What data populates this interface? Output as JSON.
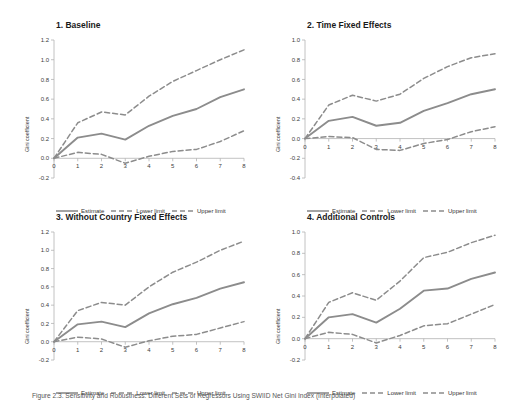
{
  "figure": {
    "caption": "Figure 2.3.  Sensitivity and Robustness: Different Sets of Regressors Using SWIID Net Gini Index (Interpolated)"
  },
  "legend": {
    "items": [
      {
        "label": "Estimate",
        "style": "solid",
        "color": "#8c8c8c"
      },
      {
        "label": "Lower limit",
        "style": "dashed",
        "color": "#8c8c8c"
      },
      {
        "label": "Upper limit",
        "style": "dashed",
        "color": "#8c8c8c"
      }
    ]
  },
  "chart_data": [
    {
      "type": "line",
      "title": "1. Baseline",
      "xlabel": "",
      "ylabel": "Gini coefficient",
      "x": [
        0,
        1,
        2,
        3,
        4,
        5,
        6,
        7,
        8
      ],
      "xticks": [
        "0",
        "1",
        "2",
        "3",
        "4",
        "5",
        "6",
        "7",
        "8"
      ],
      "yticks": [
        "-0.2",
        "0.0",
        "0.2",
        "0.4",
        "0.6",
        "0.8",
        "1.0",
        "1.2"
      ],
      "ylim": [
        -0.2,
        1.2
      ],
      "xlim": [
        0,
        8
      ],
      "grid": false,
      "series": [
        {
          "name": "Estimate",
          "style": "solid",
          "values": [
            0.0,
            0.21,
            0.25,
            0.19,
            0.33,
            0.43,
            0.5,
            0.62,
            0.7
          ]
        },
        {
          "name": "Lower limit",
          "style": "dashed",
          "values": [
            0.0,
            0.06,
            0.04,
            -0.05,
            0.02,
            0.07,
            0.09,
            0.17,
            0.28
          ]
        },
        {
          "name": "Upper limit",
          "style": "dashed",
          "values": [
            0.0,
            0.36,
            0.47,
            0.44,
            0.63,
            0.78,
            0.89,
            1.0,
            1.1
          ]
        }
      ]
    },
    {
      "type": "line",
      "title": "2. Time Fixed Effects",
      "xlabel": "",
      "ylabel": "Gini coefficient",
      "x": [
        0,
        1,
        2,
        3,
        4,
        5,
        6,
        7,
        8
      ],
      "xticks": [
        "0",
        "1",
        "2",
        "3",
        "4",
        "5",
        "6",
        "7",
        "8"
      ],
      "yticks": [
        "-0.4",
        "-0.2",
        "0.0",
        "0.2",
        "0.4",
        "0.6",
        "0.8",
        "1.0"
      ],
      "ylim": [
        -0.4,
        1.0
      ],
      "xlim": [
        0,
        8
      ],
      "grid": false,
      "series": [
        {
          "name": "Estimate",
          "style": "solid",
          "values": [
            0.0,
            0.18,
            0.22,
            0.13,
            0.16,
            0.28,
            0.36,
            0.45,
            0.5
          ]
        },
        {
          "name": "Lower limit",
          "style": "dashed",
          "values": [
            0.0,
            0.02,
            0.01,
            -0.11,
            -0.12,
            -0.05,
            -0.01,
            0.07,
            0.12
          ]
        },
        {
          "name": "Upper limit",
          "style": "dashed",
          "values": [
            0.0,
            0.34,
            0.44,
            0.38,
            0.45,
            0.61,
            0.73,
            0.82,
            0.86
          ]
        }
      ]
    },
    {
      "type": "line",
      "title": "3. Without Country Fixed Effects",
      "xlabel": "",
      "ylabel": "Gini coefficient",
      "x": [
        0,
        1,
        2,
        3,
        4,
        5,
        6,
        7,
        8
      ],
      "xticks": [
        "0",
        "1",
        "2",
        "3",
        "4",
        "5",
        "6",
        "7",
        "8"
      ],
      "yticks": [
        "-0.2",
        "0.0",
        "0.2",
        "0.4",
        "0.6",
        "0.8",
        "1.0",
        "1.2"
      ],
      "ylim": [
        -0.2,
        1.2
      ],
      "xlim": [
        0,
        8
      ],
      "grid": false,
      "series": [
        {
          "name": "Estimate",
          "style": "solid",
          "values": [
            0.0,
            0.19,
            0.22,
            0.16,
            0.31,
            0.41,
            0.48,
            0.58,
            0.65
          ]
        },
        {
          "name": "Lower limit",
          "style": "dashed",
          "values": [
            0.0,
            0.05,
            0.03,
            -0.06,
            0.01,
            0.06,
            0.08,
            0.15,
            0.22
          ]
        },
        {
          "name": "Upper limit",
          "style": "dashed",
          "values": [
            0.0,
            0.34,
            0.43,
            0.4,
            0.6,
            0.76,
            0.87,
            1.0,
            1.1
          ]
        }
      ]
    },
    {
      "type": "line",
      "title": "4. Additional Controls",
      "xlabel": "",
      "ylabel": "Gini coefficient",
      "x": [
        0,
        1,
        2,
        3,
        4,
        5,
        6,
        7,
        8
      ],
      "xticks": [
        "0",
        "1",
        "2",
        "3",
        "4",
        "5",
        "6",
        "7",
        "8"
      ],
      "yticks": [
        "-0.2",
        "0.0",
        "0.2",
        "0.4",
        "0.6",
        "0.8",
        "1.0"
      ],
      "ylim": [
        -0.2,
        1.0
      ],
      "xlim": [
        0,
        8
      ],
      "grid": false,
      "series": [
        {
          "name": "Estimate",
          "style": "solid",
          "values": [
            0.0,
            0.2,
            0.23,
            0.15,
            0.28,
            0.45,
            0.47,
            0.56,
            0.62
          ]
        },
        {
          "name": "Lower limit",
          "style": "dashed",
          "values": [
            0.0,
            0.06,
            0.04,
            -0.04,
            0.03,
            0.12,
            0.14,
            0.23,
            0.32
          ]
        },
        {
          "name": "Upper limit",
          "style": "dashed",
          "values": [
            0.0,
            0.34,
            0.43,
            0.36,
            0.54,
            0.76,
            0.81,
            0.9,
            0.97
          ]
        }
      ]
    }
  ]
}
